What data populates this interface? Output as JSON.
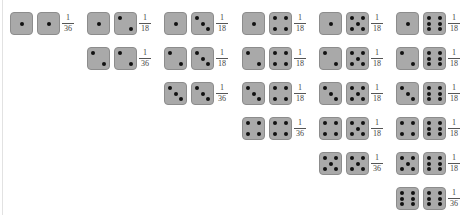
{
  "diagram": {
    "colors": {
      "die_fill": "#a9a9a9",
      "die_border": "#8c8c8c",
      "pip": "#111111",
      "fraction_text": "#444444"
    },
    "columns": [
      {
        "max": 1,
        "rows": [
          {
            "die_a": 1,
            "die_b": 1,
            "num": "1",
            "den": "36"
          }
        ]
      },
      {
        "max": 2,
        "rows": [
          {
            "die_a": 1,
            "die_b": 2,
            "num": "1",
            "den": "18"
          },
          {
            "die_a": 2,
            "die_b": 2,
            "num": "1",
            "den": "36"
          }
        ]
      },
      {
        "max": 3,
        "rows": [
          {
            "die_a": 1,
            "die_b": 3,
            "num": "1",
            "den": "18"
          },
          {
            "die_a": 2,
            "die_b": 3,
            "num": "1",
            "den": "18"
          },
          {
            "die_a": 3,
            "die_b": 3,
            "num": "1",
            "den": "36"
          }
        ]
      },
      {
        "max": 4,
        "rows": [
          {
            "die_a": 1,
            "die_b": 4,
            "num": "1",
            "den": "18"
          },
          {
            "die_a": 2,
            "die_b": 4,
            "num": "1",
            "den": "18"
          },
          {
            "die_a": 3,
            "die_b": 4,
            "num": "1",
            "den": "18"
          },
          {
            "die_a": 4,
            "die_b": 4,
            "num": "1",
            "den": "36"
          }
        ]
      },
      {
        "max": 5,
        "rows": [
          {
            "die_a": 1,
            "die_b": 5,
            "num": "1",
            "den": "18"
          },
          {
            "die_a": 2,
            "die_b": 5,
            "num": "1",
            "den": "18"
          },
          {
            "die_a": 3,
            "die_b": 5,
            "num": "1",
            "den": "18"
          },
          {
            "die_a": 4,
            "die_b": 5,
            "num": "1",
            "den": "18"
          },
          {
            "die_a": 5,
            "die_b": 5,
            "num": "1",
            "den": "36"
          }
        ]
      },
      {
        "max": 6,
        "rows": [
          {
            "die_a": 1,
            "die_b": 6,
            "num": "1",
            "den": "18"
          },
          {
            "die_a": 2,
            "die_b": 6,
            "num": "1",
            "den": "18"
          },
          {
            "die_a": 3,
            "die_b": 6,
            "num": "1",
            "den": "18"
          },
          {
            "die_a": 4,
            "die_b": 6,
            "num": "1",
            "den": "18"
          },
          {
            "die_a": 5,
            "die_b": 6,
            "num": "1",
            "den": "18"
          },
          {
            "die_a": 6,
            "die_b": 6,
            "num": "1",
            "den": "36"
          }
        ]
      }
    ]
  }
}
